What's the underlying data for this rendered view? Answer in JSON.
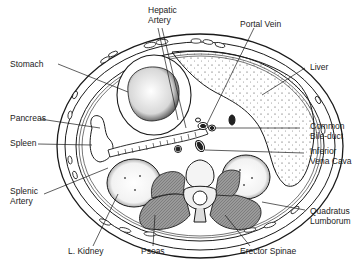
{
  "figure": {
    "colors": {
      "ink": "#1a1a1a",
      "muscle": "#8a8a8a",
      "background": "#ffffff"
    },
    "labels": [
      {
        "id": "hepatic-artery",
        "lines": [
          "Hepatic",
          "Artery"
        ]
      },
      {
        "id": "portal-vein",
        "lines": [
          "Portal Vein"
        ]
      },
      {
        "id": "stomach",
        "lines": [
          "Stomach"
        ]
      },
      {
        "id": "liver",
        "lines": [
          "Liver"
        ]
      },
      {
        "id": "pancreas",
        "lines": [
          "Pancreas"
        ]
      },
      {
        "id": "common-bile-duct",
        "lines": [
          "Common",
          "Bile-duct"
        ]
      },
      {
        "id": "spleen",
        "lines": [
          "Spleen"
        ]
      },
      {
        "id": "inferior-vena-cava",
        "lines": [
          "Inferior",
          "Vena Cava"
        ]
      },
      {
        "id": "splenic-artery",
        "lines": [
          "Splenic",
          "Artery"
        ]
      },
      {
        "id": "quadratus-lumborum",
        "lines": [
          "Quadratus",
          "Lumborum"
        ]
      },
      {
        "id": "l-kidney",
        "lines": [
          "L. Kidney"
        ]
      },
      {
        "id": "psoas",
        "lines": [
          "Psoas"
        ]
      },
      {
        "id": "erector-spinae",
        "lines": [
          "Erector Spinae"
        ]
      }
    ]
  }
}
